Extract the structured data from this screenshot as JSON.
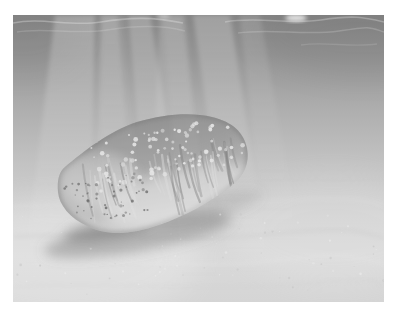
{
  "image": {
    "kind": "underwater photograph, monochrome",
    "alt": "A plump sea cucumber resting on a pale sandy seafloor, photographed underwater with diagonal sun rays streaming down from the rippled water surface above and a soft shadow beneath the animal",
    "subject": "sea cucumber",
    "subject_features": [
      "pale round papillae dotting the upper body",
      "dark speckles clustered near the left end",
      "vertical wrinkles with light highlights along the lower flank",
      "soft dark shadow cast on the sand below"
    ],
    "environment": [
      "water surface with ripple highlights at the top",
      "bright spot of light at the surface upper right",
      "crisscrossing light rays widening toward the seafloor",
      "smooth pale sand with faint ripple streaks"
    ]
  },
  "palette": {
    "frame": "#ffffff",
    "water_top": "#868686",
    "water_upper": "#959595",
    "water_mid": "#adadad",
    "water_lower": "#c3c3c3",
    "sand_upper": "#d2d2d2",
    "sand": "#d9d9d9",
    "sand_bottom": "#d5d5d5",
    "ray_light": "#ffffff",
    "surface_ripple": "#c2c2c2",
    "surface_glint": "#f4f4f4",
    "body_dark": "#8c8c8c",
    "body_mid": "#a8a8a8",
    "body_light": "#cdcdcd",
    "papillae": "#e6e6e6",
    "speckle": "#6b6b6b",
    "wrinkle_light": "#dedede",
    "wrinkle_dark": "#7f7f7f",
    "rim_shadow": "#5f5f5f",
    "shadow": "#6e6e6e",
    "sand_fleck_light": "#efefef",
    "sand_fleck_dark": "#bdbdbd"
  },
  "texture": {
    "papillae": {
      "count": 95,
      "min_r": 0.9,
      "max_r": 2.5
    },
    "speckles": {
      "count": 58,
      "min_r": 0.6,
      "max_r": 1.7
    },
    "wrinkles": {
      "count": 48
    },
    "sand_flecks": {
      "count": 75
    }
  }
}
